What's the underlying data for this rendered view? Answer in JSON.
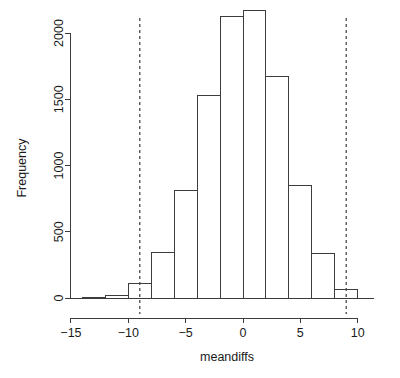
{
  "chart_data": {
    "type": "bar",
    "subtype": "histogram",
    "title": "",
    "xlabel": "meandiffs",
    "ylabel": "Frequency",
    "xlim": [
      -15.6,
      11.6
    ],
    "ylim": [
      0,
      2260
    ],
    "grid": false,
    "legend": null,
    "bin_width": 2,
    "x_ticks": [
      -15,
      -10,
      -5,
      0,
      5,
      10
    ],
    "x_tick_labels": [
      "−15",
      "−10",
      "−5",
      "0",
      "5",
      "10"
    ],
    "y_ticks": [
      0,
      500,
      1000,
      1500,
      2000
    ],
    "y_tick_labels": [
      "0",
      "500",
      "1000",
      "1500",
      "2000"
    ],
    "bins": [
      {
        "x0": -14,
        "x1": -12,
        "value": 4
      },
      {
        "x0": -12,
        "x1": -10,
        "value": 22
      },
      {
        "x0": -10,
        "x1": -8,
        "value": 112
      },
      {
        "x0": -8,
        "x1": -6,
        "value": 345
      },
      {
        "x0": -6,
        "x1": -4,
        "value": 812
      },
      {
        "x0": -4,
        "x1": -2,
        "value": 1530
      },
      {
        "x0": -2,
        "x1": 0,
        "value": 2125
      },
      {
        "x0": 0,
        "x1": 2,
        "value": 2170
      },
      {
        "x0": 2,
        "x1": 4,
        "value": 1668
      },
      {
        "x0": 4,
        "x1": 6,
        "value": 852
      },
      {
        "x0": 6,
        "x1": 8,
        "value": 337
      },
      {
        "x0": 8,
        "x1": 10,
        "value": 66
      }
    ],
    "annotations": [
      {
        "name": "lower-reference-line",
        "type": "vline",
        "x": -9,
        "style": "dashed"
      },
      {
        "name": "upper-reference-line",
        "type": "vline",
        "x": 9,
        "style": "dashed"
      }
    ],
    "colors": {
      "bar_fill": "#ffffff",
      "bar_stroke": "#3c3c3c",
      "axis": "#3c3c3c",
      "reference_line": "#4a4a4a",
      "text": "#1a1a1a",
      "background": "#ffffff"
    }
  }
}
